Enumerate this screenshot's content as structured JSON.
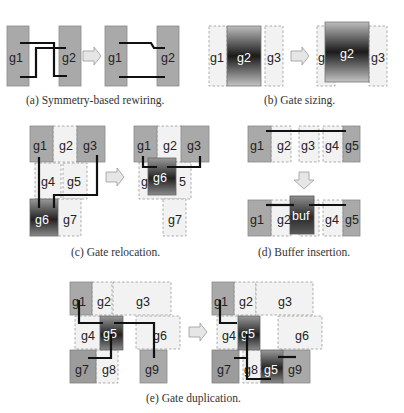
{
  "figure": {
    "panels": [
      {
        "id": "a",
        "caption": "(a) Symmetry-based rewiring.",
        "gates_before": [
          "g1",
          "g2"
        ],
        "gates_after": [
          "g1",
          "g2"
        ]
      },
      {
        "id": "b",
        "caption": "(b) Gate sizing.",
        "gates_before": [
          "g1",
          "g2",
          "g3"
        ],
        "gates_after": [
          "g",
          "g2",
          "g3"
        ]
      },
      {
        "id": "c",
        "caption": "(c) Gate relocation.",
        "gates_before": [
          "g1",
          "g2",
          "g3",
          "g4",
          "g5",
          "g6",
          "g7"
        ],
        "gates_after": [
          "g1",
          "g2",
          "g3",
          "g",
          "g6",
          "5",
          "g7"
        ]
      },
      {
        "id": "d",
        "caption": "(d) Buffer insertion.",
        "gates_before": [
          "g1",
          "g2",
          "g3",
          "g4",
          "g5"
        ],
        "gates_after": [
          "g1",
          "g2",
          "buf",
          "g4",
          "g5"
        ]
      },
      {
        "id": "e",
        "caption": "(e) Gate duplication.",
        "gates_before": [
          "g1",
          "g2",
          "g3",
          "g4",
          "g5",
          "g6",
          "g7",
          "g8",
          "g9"
        ],
        "gates_after": [
          "g1",
          "g2",
          "g3",
          "g4",
          "g5",
          "g6",
          "g7",
          "g8",
          "g5",
          "g9"
        ]
      }
    ]
  },
  "labels": {
    "g": "g",
    "g1": "g1",
    "g2": "g2",
    "g3": "g3",
    "g4": "g4",
    "g5": "g5",
    "g6": "g6",
    "g7": "g7",
    "g8": "g8",
    "g9": "g9",
    "buf": "buf",
    "five": "5"
  },
  "colors": {
    "solid_gate": "#a9a9a9",
    "dashed_gate": "#f2f2f2",
    "wire": "#111111",
    "arrow_fill": "#e6e6e6"
  }
}
